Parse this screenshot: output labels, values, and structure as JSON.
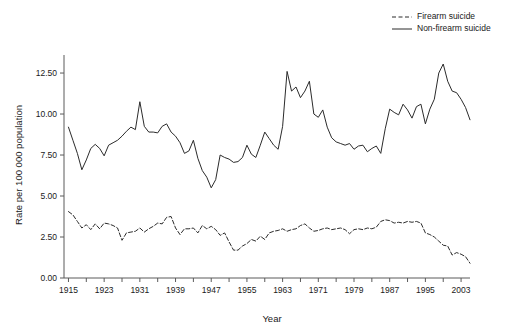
{
  "chart_data": {
    "type": "line",
    "title": "",
    "xlabel": "Year",
    "ylabel": "Rate per 100 000 population",
    "xlim": [
      1914,
      2005
    ],
    "ylim": [
      0,
      13.6
    ],
    "grid": false,
    "legend_position": "top-right",
    "y_ticks": [
      "0.00",
      "2.50",
      "5.00",
      "7.50",
      "10.00",
      "12.50"
    ],
    "y_tick_values": [
      0,
      2.5,
      5,
      7.5,
      10,
      12.5
    ],
    "x_ticks": [
      "1915",
      "1923",
      "1931",
      "1939",
      "1947",
      "1955",
      "1963",
      "1971",
      "1979",
      "1987",
      "1995",
      "2003"
    ],
    "x_tick_values": [
      1915,
      1923,
      1931,
      1939,
      1947,
      1955,
      1963,
      1971,
      1979,
      1987,
      1995,
      2003
    ],
    "x_minor_tick_values": [
      1919,
      1927,
      1935,
      1943,
      1951,
      1959,
      1967,
      1975,
      1983,
      1991,
      1999
    ],
    "x": [
      1915,
      1916,
      1917,
      1918,
      1919,
      1920,
      1921,
      1922,
      1923,
      1924,
      1925,
      1926,
      1927,
      1928,
      1929,
      1930,
      1931,
      1932,
      1933,
      1934,
      1935,
      1936,
      1937,
      1938,
      1939,
      1940,
      1941,
      1942,
      1943,
      1944,
      1945,
      1946,
      1947,
      1948,
      1949,
      1950,
      1951,
      1952,
      1953,
      1954,
      1955,
      1956,
      1957,
      1958,
      1959,
      1960,
      1961,
      1962,
      1963,
      1964,
      1965,
      1966,
      1967,
      1968,
      1969,
      1970,
      1971,
      1972,
      1973,
      1974,
      1975,
      1976,
      1977,
      1978,
      1979,
      1980,
      1981,
      1982,
      1983,
      1984,
      1985,
      1986,
      1987,
      1988,
      1989,
      1990,
      1991,
      1992,
      1993,
      1994,
      1995,
      1996,
      1997,
      1998,
      1999,
      2000,
      2001,
      2002,
      2003,
      2004,
      2005
    ],
    "series": [
      {
        "name": "Firearm suicide",
        "style": "dashed",
        "color": "#2b2b2b",
        "values": [
          4.05,
          3.85,
          3.45,
          3.05,
          3.25,
          2.95,
          3.3,
          3.0,
          3.35,
          3.3,
          3.2,
          3.05,
          2.3,
          2.75,
          2.8,
          2.85,
          3.05,
          2.8,
          3.0,
          3.15,
          3.35,
          3.3,
          3.7,
          3.75,
          3.05,
          2.65,
          3.0,
          3.0,
          3.05,
          2.75,
          3.2,
          3.0,
          3.15,
          2.95,
          2.6,
          2.75,
          2.2,
          1.7,
          1.7,
          1.95,
          2.1,
          2.35,
          2.25,
          2.55,
          2.35,
          2.75,
          2.85,
          2.9,
          3.0,
          2.85,
          2.95,
          3.0,
          3.2,
          3.3,
          3.05,
          2.85,
          2.9,
          3.0,
          3.05,
          2.95,
          3.0,
          3.05,
          2.95,
          2.7,
          2.95,
          3.0,
          2.95,
          3.05,
          3.0,
          3.1,
          3.45,
          3.55,
          3.5,
          3.35,
          3.4,
          3.35,
          3.45,
          3.4,
          3.45,
          3.35,
          2.75,
          2.65,
          2.5,
          2.25,
          2.0,
          1.95,
          1.4,
          1.55,
          1.45,
          1.3,
          0.9
        ]
      },
      {
        "name": "Non-firearm suicide",
        "style": "solid",
        "color": "#2b2b2b",
        "values": [
          9.2,
          8.4,
          7.6,
          6.6,
          7.2,
          7.9,
          8.15,
          7.9,
          7.45,
          8.1,
          8.25,
          8.4,
          8.65,
          8.95,
          9.2,
          9.05,
          10.75,
          9.25,
          8.9,
          8.9,
          8.85,
          9.25,
          9.4,
          8.9,
          8.65,
          8.25,
          7.6,
          7.75,
          8.4,
          7.3,
          6.55,
          6.15,
          5.5,
          6.0,
          7.5,
          7.35,
          7.25,
          7.05,
          7.1,
          7.35,
          8.1,
          7.55,
          7.35,
          8.1,
          8.9,
          8.5,
          8.1,
          7.85,
          9.25,
          12.6,
          11.4,
          11.65,
          11.0,
          11.4,
          12.0,
          10.0,
          9.8,
          10.25,
          9.2,
          8.55,
          8.3,
          8.2,
          8.1,
          8.2,
          7.85,
          8.05,
          8.1,
          7.7,
          7.9,
          8.05,
          7.6,
          9.1,
          10.3,
          10.1,
          9.95,
          10.6,
          10.25,
          9.75,
          10.45,
          10.6,
          9.4,
          10.3,
          10.9,
          12.5,
          13.05,
          12.0,
          11.4,
          11.3,
          10.9,
          10.4,
          9.65
        ]
      }
    ]
  },
  "legend": {
    "items": [
      {
        "label": "Firearm suicide",
        "style": "dashed"
      },
      {
        "label": "Non-firearm suicide",
        "style": "solid"
      }
    ]
  },
  "axes": {
    "x_title": "Year",
    "y_title": "Rate per 100 000 population"
  }
}
